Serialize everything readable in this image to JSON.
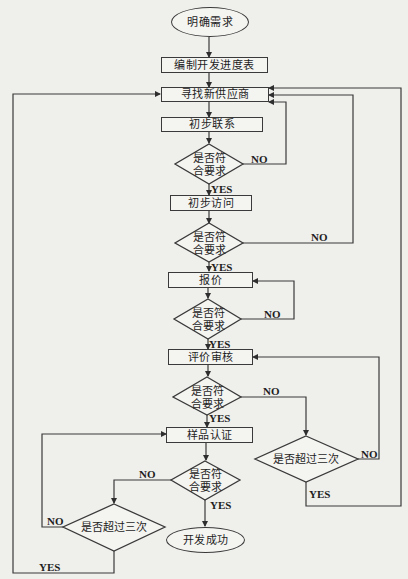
{
  "diagram": {
    "type": "flowchart",
    "start": "明确需求",
    "end": "开发成功",
    "processes": {
      "schedule": "编制开发进度表",
      "find_supplier": "寻找新供应商",
      "initial_contact": "初步联系",
      "initial_visit": "初步访问",
      "quote": "报价",
      "evaluation": "评价审核",
      "sample_cert": "样品认证"
    },
    "decisions": {
      "meets_req_line1": "是否符",
      "meets_req_line2": "合要求",
      "exceeds_three": "是否超过三次"
    },
    "edge_labels": {
      "yes": "YES",
      "no": "NO"
    }
  }
}
